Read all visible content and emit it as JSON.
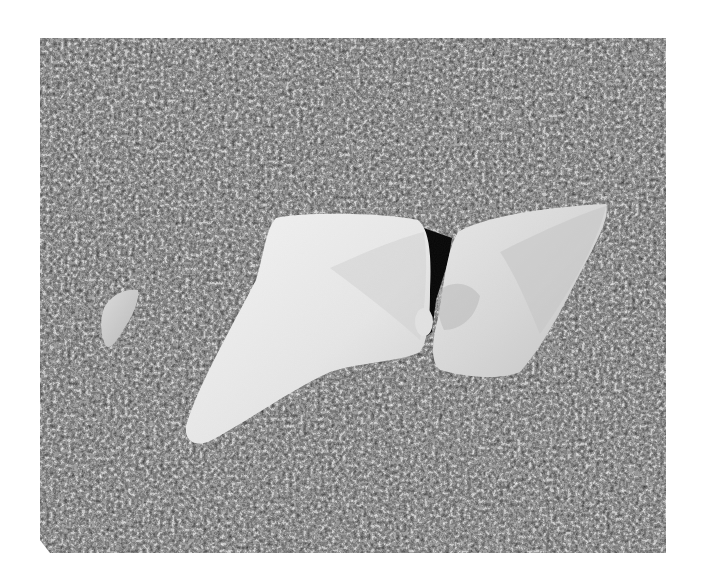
{
  "image": {
    "kind": "photograph",
    "style": "black-and-white",
    "subject": "three pale smooth stones partially buried in dark pebbly gravel",
    "background_color": "#ffffff",
    "frame": {
      "x": 40,
      "y": 38,
      "width": 626,
      "height": 515
    },
    "elements": [
      {
        "name": "small-stone-left",
        "tone": "#d9d9d9"
      },
      {
        "name": "large-stone-center",
        "tone": "#ececec"
      },
      {
        "name": "stone-right",
        "tone": "#dedede"
      },
      {
        "name": "shadow-crevice",
        "tone": "#050505"
      },
      {
        "name": "gravel-field",
        "tone": "#3a3a3a"
      }
    ]
  }
}
